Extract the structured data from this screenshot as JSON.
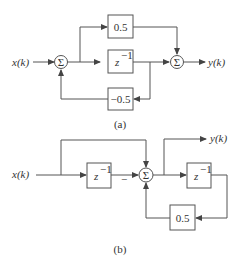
{
  "diagram_a": {
    "caption": "(a)",
    "input": "x(k)",
    "output": "y(k)",
    "sum_symbol": "Σ",
    "blocks": {
      "gain_top": "0.5",
      "delay": "z",
      "delay_exp": "−1",
      "gain_feedback": "−0.5"
    }
  },
  "diagram_b": {
    "caption": "(b)",
    "input": "x(k)",
    "output": "y(k)",
    "sum_symbol": "Σ",
    "minus_sign": "−",
    "blocks": {
      "delay1": "z",
      "delay1_exp": "−1",
      "delay2": "z",
      "delay2_exp": "−1",
      "gain_feedback": "0.5"
    }
  }
}
